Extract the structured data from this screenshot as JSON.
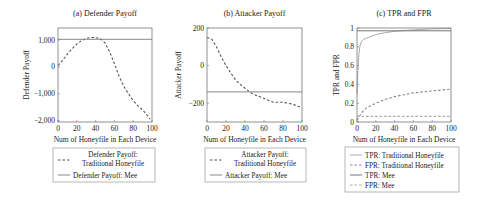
{
  "chart_data": [
    {
      "type": "line",
      "title": "(a) Defender Payoff",
      "xlabel": "Num of Honeyfile in Each Device",
      "ylabel": "Defender Payoff",
      "xlim": [
        0,
        100
      ],
      "ylim": [
        -2050,
        1450
      ],
      "xticks": [
        0,
        20,
        40,
        60,
        80,
        100
      ],
      "xtick_labels": [
        "0",
        "20",
        "40",
        "60",
        "80",
        "100"
      ],
      "yticks": [
        -2000,
        -1000,
        0,
        1000
      ],
      "ytick_labels": [
        "−2,000",
        "−1,000",
        "0",
        "1,000"
      ],
      "grid": false,
      "legend_position": "below",
      "series": [
        {
          "name": "Defender Payoff: Traditional Honeyfile",
          "style": "dashed",
          "color": "#555555",
          "x": [
            0,
            5,
            10,
            15,
            20,
            25,
            30,
            35,
            40,
            45,
            50,
            55,
            60,
            65,
            70,
            75,
            80,
            85,
            90,
            95,
            98
          ],
          "y": [
            50,
            250,
            480,
            680,
            850,
            980,
            1060,
            1100,
            1090,
            1060,
            900,
            560,
            120,
            -350,
            -720,
            -1000,
            -1250,
            -1450,
            -1600,
            -1800,
            -1950
          ]
        },
        {
          "name": "Defender Payoff: Mee",
          "style": "solid",
          "color": "#888888",
          "x": [
            0,
            100
          ],
          "y": [
            1030,
            1030
          ]
        }
      ],
      "legend": [
        "Defender Payoff:\nTraditional Honeyfile",
        "Defender Payoff: Mee"
      ]
    },
    {
      "type": "line",
      "title": "(b) Attacker Payoff",
      "xlabel": "Num of Honeyfile in Each Device",
      "ylabel": "Attacker Payoff",
      "xlim": [
        0,
        100
      ],
      "ylim": [
        -300,
        200
      ],
      "xticks": [
        0,
        20,
        40,
        60,
        80,
        100
      ],
      "xtick_labels": [
        "0",
        "20",
        "40",
        "60",
        "80",
        "100"
      ],
      "yticks": [
        -200,
        0,
        200
      ],
      "ytick_labels": [
        "−200",
        "0",
        "200"
      ],
      "grid": false,
      "legend_position": "below",
      "series": [
        {
          "name": "Attacker Payoff: Traditional Honeyfile",
          "style": "dashed",
          "color": "#555555",
          "x": [
            0,
            5,
            10,
            15,
            20,
            25,
            30,
            35,
            40,
            45,
            50,
            55,
            60,
            65,
            70,
            75,
            80,
            85,
            90,
            95,
            98
          ],
          "y": [
            150,
            140,
            100,
            45,
            0,
            -40,
            -75,
            -100,
            -120,
            -140,
            -155,
            -165,
            -175,
            -185,
            -195,
            -195,
            -195,
            -200,
            -205,
            -215,
            -220
          ]
        },
        {
          "name": "Attacker Payoff: Mee",
          "style": "solid",
          "color": "#888888",
          "x": [
            0,
            100
          ],
          "y": [
            -140,
            -140
          ]
        }
      ],
      "legend": [
        "Attacker Payoff:\nTraditional Honeyfile",
        "Attacker Payoff: Mee"
      ]
    },
    {
      "type": "line",
      "title": "(c) TPR and FPR",
      "xlabel": "Num of Honeyfile in Each Device",
      "ylabel": "TPR and FPR",
      "xlim": [
        0,
        100
      ],
      "ylim": [
        0,
        1
      ],
      "xticks": [
        0,
        20,
        40,
        60,
        80,
        100
      ],
      "xtick_labels": [
        "0",
        "20",
        "40",
        "60",
        "80",
        "100"
      ],
      "yticks": [
        0,
        0.2,
        0.4,
        0.6,
        0.8,
        1
      ],
      "ytick_labels": [
        "0",
        "0.2",
        "0.4",
        "0.6",
        "0.8",
        "1"
      ],
      "grid": false,
      "legend_position": "below",
      "series": [
        {
          "name": "TPR: Traditional Honeyfile",
          "style": "solid",
          "color": "#aaaaaa",
          "x": [
            0,
            1,
            2,
            3,
            4,
            5,
            7,
            10,
            15,
            20,
            30,
            40,
            60,
            80,
            100
          ],
          "y": [
            0.3,
            0.55,
            0.72,
            0.8,
            0.84,
            0.86,
            0.88,
            0.89,
            0.91,
            0.93,
            0.95,
            0.965,
            0.98,
            0.99,
            0.995
          ]
        },
        {
          "name": "FPR: Traditional Honeyfile",
          "style": "dashed",
          "color": "#888888",
          "x": [
            0,
            5,
            10,
            20,
            30,
            40,
            50,
            60,
            70,
            80,
            90,
            100
          ],
          "y": [
            0.02,
            0.1,
            0.15,
            0.2,
            0.24,
            0.27,
            0.29,
            0.31,
            0.32,
            0.33,
            0.34,
            0.35
          ]
        },
        {
          "name": "TPR: Mee",
          "style": "solid",
          "color": "#777777",
          "x": [
            0,
            100
          ],
          "y": [
            0.97,
            0.97
          ]
        },
        {
          "name": "FPR: Mee",
          "style": "dashed",
          "color": "#aaaaaa",
          "x": [
            0,
            100
          ],
          "y": [
            0.06,
            0.06
          ]
        }
      ],
      "legend": [
        "TPR: Traditional Honeyfile",
        "FPR: Traditional Honeyfile",
        "TPR: Mee",
        "FPR: Mee"
      ]
    }
  ],
  "panels": {
    "a": {
      "title": "(a) Defender Payoff",
      "xlabel": "Num of Honeyfile in Each Device",
      "ylabel": "Defender Payoff",
      "legend_line1a": "Defender Payoff:",
      "legend_line1b": "Traditional Honeyfile",
      "legend_line2": "Defender Payoff: Mee"
    },
    "b": {
      "title": "(b) Attacker Payoff",
      "xlabel": "Num of Honeyfile in Each Device",
      "ylabel": "Attacker Payoff",
      "legend_line1a": "Attacker Payoff:",
      "legend_line1b": "Traditional Honeyfile",
      "legend_line2": "Attacker Payoff: Mee"
    },
    "c": {
      "title": "(c) TPR and FPR",
      "xlabel": "Num of Honeyfile in Each Device",
      "ylabel": "TPR and FPR",
      "legend": [
        "TPR: Traditional Honeyfile",
        "FPR: Traditional Honeyfile",
        "TPR: Mee",
        "FPR: Mee"
      ]
    }
  }
}
